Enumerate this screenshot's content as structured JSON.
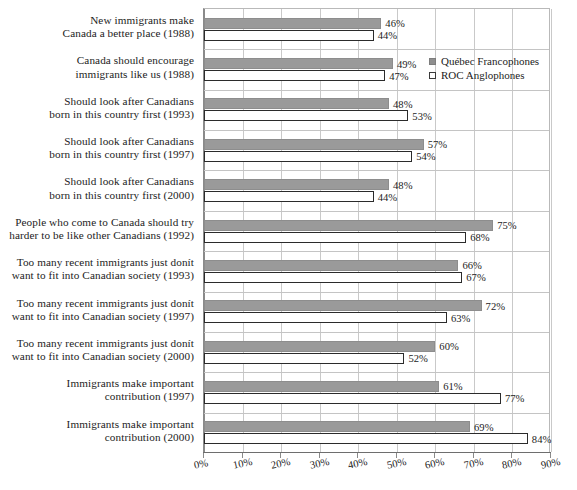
{
  "chart_data": {
    "type": "bar",
    "orientation": "horizontal",
    "title": "",
    "xlabel": "",
    "ylabel": "",
    "xlim": [
      0,
      90
    ],
    "xtick_labels": [
      "0%",
      "10%",
      "20%",
      "30%",
      "40%",
      "50%",
      "60%",
      "70%",
      "80%",
      "90%"
    ],
    "xticks": [
      0,
      10,
      20,
      30,
      40,
      50,
      60,
      70,
      80,
      90
    ],
    "grid": true,
    "legend_position": "top-right",
    "value_label_suffix": "%",
    "categories": [
      "New immigrants make\nCanada a better place (1988)",
      "Canada should encourage\nimmigrants like us (1988)",
      "Should look after Canadians\nborn in this country first (1993)",
      "Should look after Canadians\nborn in this country first (1997)",
      "Should look after Canadians\nborn in this country first (2000)",
      "People who come to Canada should try\nharder to be like other Canadians (1992)",
      "Too many recent immigrants just donít\nwant to fit into Canadian society (1993)",
      "Too many recent immigrants just donít\nwant to fit into Canadian society (1997)",
      "Too many recent immigrants just donít\nwant to fit into Canadian society (2000)",
      "Immigrants make important\ncontribution (1997)",
      "Immigrants make important\ncontribution (2000)"
    ],
    "series": [
      {
        "name": "Québec Francophones",
        "color": "#9a9a9a",
        "values": [
          46,
          49,
          48,
          57,
          48,
          75,
          66,
          72,
          60,
          61,
          69
        ],
        "value_labels": [
          "46%",
          "49%",
          "48%",
          "57%",
          "48%",
          "75%",
          "66%",
          "72%",
          "60%",
          "61%",
          "69%"
        ]
      },
      {
        "name": "ROC Anglophones",
        "color": "#ffffff",
        "values": [
          44,
          47,
          53,
          54,
          44,
          68,
          67,
          63,
          52,
          77,
          84
        ],
        "value_labels": [
          "44%",
          "47%",
          "53%",
          "54%",
          "44%",
          "68%",
          "67%",
          "63%",
          "52%",
          "77%",
          "84%"
        ]
      }
    ]
  },
  "colors": {
    "series_quebec": "#9a9a9a",
    "series_roc": "#ffffff",
    "series_roc_border": "#2b2b2b",
    "gridline": "#c9c9c9",
    "axis": "#6e6e6e",
    "text": "#1c1c1c",
    "background": "#ffffff"
  }
}
